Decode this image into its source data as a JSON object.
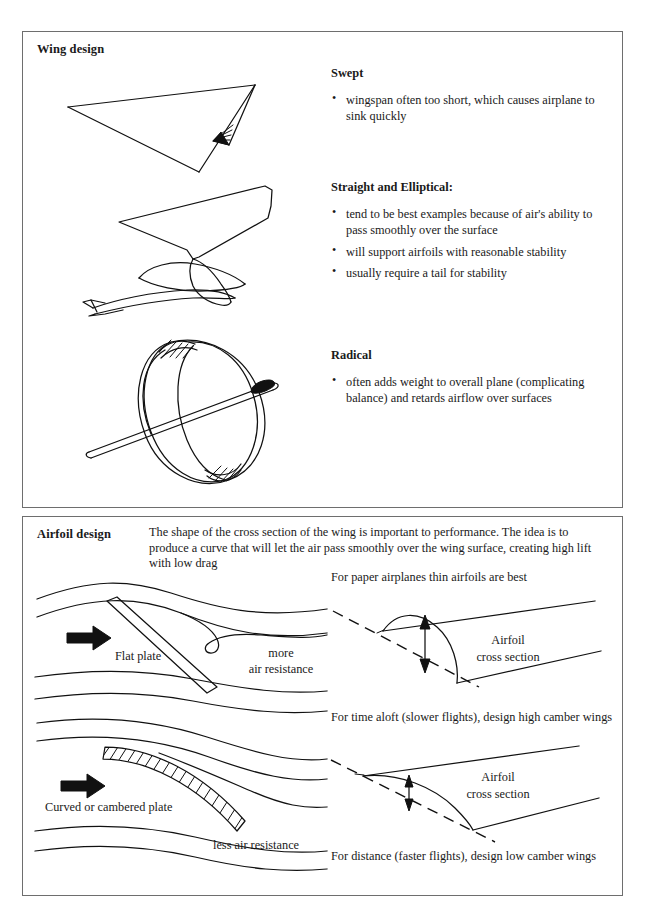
{
  "document": {
    "sections": [
      {
        "id": "wing-design",
        "title": "Wing design",
        "groups": [
          {
            "heading": "Swept",
            "bullets": [
              "wingspan often too short, which causes airplane to sink quickly"
            ],
            "figure": "swept-dart-wing"
          },
          {
            "heading": "Straight and Elliptical:",
            "bullets": [
              "tend to be best examples because of air's ability to pass smoothly over the surface",
              "will support airfoils with reasonable stability",
              "usually require a tail for stability"
            ],
            "figure": "straight-and-elliptical-glider"
          },
          {
            "heading": "Radical",
            "bullets": [
              "often adds weight to overall plane (complicating balance) and retards airflow over surfaces"
            ],
            "figure": "radical-ring-wing"
          }
        ]
      },
      {
        "id": "airfoil-design",
        "title": "Airfoil design",
        "intro": "The shape of the cross section of the wing is important to performance. The idea is to produce a curve that will let the air pass smoothly over the wing surface, creating high lift with low drag",
        "figures": {
          "flat_plate": {
            "plate_label": "Flat plate",
            "resistance_label_line1": "more",
            "resistance_label_line2": "air resistance",
            "flow_arrow": "flow-direction-arrow"
          },
          "cambered_plate": {
            "plate_label": "Curved or cambered plate",
            "resistance_label": "less air resistance",
            "flow_arrow": "flow-direction-arrow"
          },
          "high_camber": {
            "caption_above": "For paper airplanes thin airfoils are best",
            "caption_below": "For time aloft (slower flights), design high camber wings",
            "section_label_line1": "Airfoil",
            "section_label_line2": "cross section",
            "camber_marker": "camber-height-arrow"
          },
          "low_camber": {
            "caption_below": "For distance (faster flights), design low camber wings",
            "section_label_line1": "Airfoil",
            "section_label_line2": "cross section",
            "camber_marker": "camber-height-arrow"
          }
        }
      }
    ]
  },
  "colors": {
    "ink": "#111111",
    "border": "#6e6e6e",
    "paper": "#ffffff"
  }
}
